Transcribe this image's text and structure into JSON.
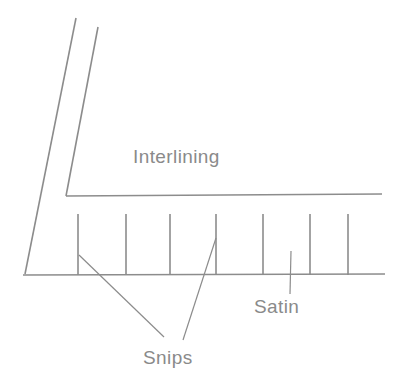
{
  "figure": {
    "background_color": "#ffffff",
    "line_color": "#8c8c8c",
    "text_color": "#8a8a8a"
  },
  "labels": {
    "interlining": "Interlining",
    "satin": "Satin",
    "snips": "Snips"
  },
  "chart_data": {
    "type": "diagram",
    "width": 399,
    "height": 380,
    "stroke_color": "#8c8c8c",
    "stroke_width": 1.6,
    "text_color": "#8a8a8a",
    "elements": {
      "interlining_outer_edge": {
        "name": "interlining-outer-diagonal",
        "x1": 76,
        "y1": 18,
        "x2": 25,
        "y2": 274
      },
      "interlining_fold": {
        "name": "interlining-fold-diagonal",
        "x1": 98,
        "y1": 27,
        "x2": 66,
        "y2": 196
      },
      "interlining_horizontal": {
        "name": "interlining-horizontal-edge",
        "x1": 66,
        "y1": 196,
        "x2": 382,
        "y2": 194
      },
      "satin_baseline": {
        "name": "satin-baseline",
        "x1": 23,
        "y1": 275,
        "x2": 385,
        "y2": 274
      },
      "satin_snip_ticks": {
        "name": "satin-snip-ticks",
        "y_top": 214,
        "y_bottom": 275,
        "x_positions": [
          78,
          126,
          170,
          216,
          263,
          310,
          348
        ]
      },
      "leader_snips_left": {
        "name": "leader-line-snips-left",
        "x1": 79,
        "y1": 255,
        "x2": 164,
        "y2": 337
      },
      "leader_snips_right": {
        "name": "leader-line-snips-right",
        "x1": 216,
        "y1": 238,
        "x2": 183,
        "y2": 340
      },
      "leader_satin": {
        "name": "leader-line-satin",
        "x1": 291,
        "y1": 251,
        "x2": 290,
        "y2": 294
      }
    },
    "annotations": [
      {
        "text": "Interlining",
        "x": 133,
        "y": 163,
        "font_size": 19,
        "anchor": "start"
      },
      {
        "text": "Satin",
        "x": 254,
        "y": 313,
        "font_size": 19,
        "anchor": "start"
      },
      {
        "text": "Snips",
        "x": 143,
        "y": 364,
        "font_size": 19,
        "anchor": "start"
      }
    ],
    "axis_ranges": {
      "x": [
        0,
        399
      ],
      "y": [
        0,
        380
      ]
    },
    "grid": false,
    "legend": "none"
  }
}
